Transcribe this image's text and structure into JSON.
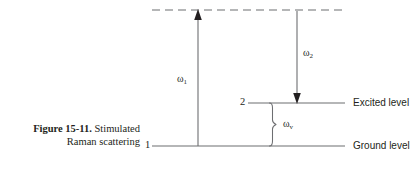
{
  "figure": {
    "caption_label": "Figure 15-11.",
    "caption_text_line1": "Stimulated",
    "caption_text_line2": "Raman scattering"
  },
  "diagram": {
    "type": "energy-level-diagram",
    "stroke_color": "#6d6e71",
    "text_color": "#231f20",
    "levels": [
      {
        "id": "virtual",
        "style": "dashed",
        "number": "",
        "right_label": "",
        "y": 10,
        "x_start": 152,
        "x_end": 345
      },
      {
        "id": "excited",
        "style": "solid",
        "number": "2",
        "right_label": "Excited level",
        "y": 103,
        "x_start": 248,
        "x_end": 345
      },
      {
        "id": "ground",
        "style": "solid",
        "number": "1",
        "right_label": "Ground level",
        "y": 146,
        "x_start": 152,
        "x_end": 345
      }
    ],
    "arrows": [
      {
        "id": "pump",
        "label": "ω",
        "sub": "1",
        "direction": "up",
        "x": 198,
        "y_from": 146,
        "y_to": 12,
        "label_x": 177,
        "label_y": 74
      },
      {
        "id": "stokes",
        "label": "ω",
        "sub": "2",
        "direction": "down",
        "x": 297,
        "y_from": 11,
        "y_to": 101,
        "label_x": 303,
        "label_y": 48
      }
    ],
    "brace": {
      "id": "vibrational",
      "label": "ω",
      "sub": "v",
      "x": 272,
      "y_top": 103,
      "y_bottom": 146,
      "label_x": 283,
      "label_y": 119
    }
  }
}
